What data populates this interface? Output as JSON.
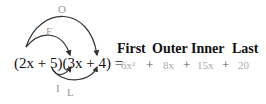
{
  "diagram": {
    "expression": "(2x + 5)(3x + 4) =",
    "arrow_labels": {
      "outer": "O",
      "first": "F",
      "inner": "I",
      "last": "L"
    },
    "headers": [
      "First",
      "Outer",
      "Inner",
      "Last"
    ],
    "terms": [
      "6x²",
      "8x",
      "15x",
      "20"
    ],
    "plus": "+"
  }
}
